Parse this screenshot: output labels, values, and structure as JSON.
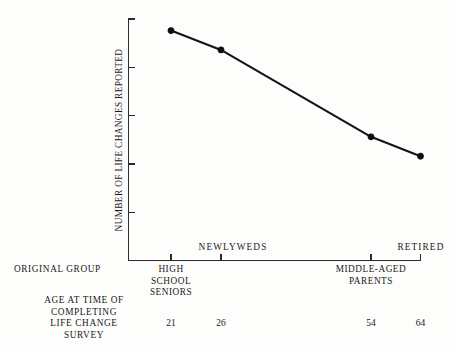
{
  "chart_data": {
    "type": "line",
    "title": "",
    "xlabel": "",
    "ylabel": "NUMBER OF LIFE CHANGES REPORTED",
    "ylim": [
      0,
      25
    ],
    "yticks": [
      0,
      5,
      10,
      15,
      20,
      25
    ],
    "ytick_labels": [
      "0",
      "5",
      "10",
      "15",
      "20",
      "25"
    ],
    "grid": false,
    "legend": "none",
    "categories": [
      "HIGH SCHOOL SENIORS",
      "NEWLYWEDS",
      "MIDDLE-AGED PARENTS",
      "RETIRED"
    ],
    "x": [
      21,
      26,
      54,
      64
    ],
    "values": [
      23.8,
      21.8,
      12.8,
      10.8
    ],
    "series": [
      {
        "name": "Number of life changes reported",
        "values": [
          23.8,
          21.8,
          12.8,
          10.8
        ]
      }
    ],
    "annotations": [
      {
        "text": "NEWLYWEDS",
        "position": "above-axis-left-center"
      },
      {
        "text": "RETIRED",
        "position": "above-axis-right"
      }
    ]
  },
  "axes": {
    "y_title": "NUMBER OF LIFE CHANGES REPORTED",
    "y_ticks": [
      {
        "label": "25",
        "value": 25
      },
      {
        "label": "20",
        "value": 20
      },
      {
        "label": "15",
        "value": 15
      },
      {
        "label": "10",
        "value": 10
      },
      {
        "label": "5",
        "value": 5
      },
      {
        "label": "0",
        "value": 0
      }
    ]
  },
  "inplot_labels": {
    "newlyweds": "NEWLYWEDS",
    "retired": "RETIRED"
  },
  "row_captions": {
    "original_group": "ORIGINAL GROUP",
    "age_survey_line1": "AGE AT TIME OF",
    "age_survey_line2": "COMPLETING",
    "age_survey_line3": "LIFE CHANGE",
    "age_survey_line4": "SURVEY"
  },
  "group_labels": {
    "high_school_line1": "HIGH",
    "high_school_line2": "SCHOOL",
    "high_school_line3": "SENIORS",
    "middle_aged_line1": "MIDDLE-AGED",
    "middle_aged_line2": "PARENTS"
  },
  "ages": [
    {
      "label": "21"
    },
    {
      "label": "26"
    },
    {
      "label": "54"
    },
    {
      "label": "64"
    }
  ],
  "colors": {
    "ink": "#1a1a1a",
    "line": "#141414",
    "marker": "#0d0d0d",
    "background": "#fdfdfc"
  }
}
